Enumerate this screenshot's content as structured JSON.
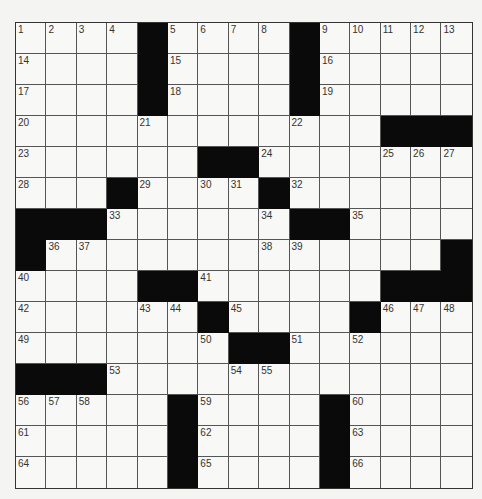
{
  "puzzle": {
    "rows": 15,
    "cols": 15,
    "colors": {
      "black": "#0a0a0a",
      "white": "#f8f8f6",
      "line": "#555555"
    },
    "black_cells": [
      [
        0,
        4
      ],
      [
        0,
        9
      ],
      [
        1,
        4
      ],
      [
        1,
        9
      ],
      [
        2,
        4
      ],
      [
        2,
        9
      ],
      [
        3,
        12
      ],
      [
        3,
        13
      ],
      [
        3,
        14
      ],
      [
        4,
        6
      ],
      [
        4,
        7
      ],
      [
        5,
        3
      ],
      [
        5,
        8
      ],
      [
        6,
        0
      ],
      [
        6,
        1
      ],
      [
        6,
        2
      ],
      [
        6,
        9
      ],
      [
        6,
        10
      ],
      [
        7,
        0
      ],
      [
        7,
        14
      ],
      [
        8,
        4
      ],
      [
        8,
        5
      ],
      [
        8,
        12
      ],
      [
        8,
        13
      ],
      [
        8,
        14
      ],
      [
        9,
        6
      ],
      [
        9,
        11
      ],
      [
        10,
        7
      ],
      [
        10,
        8
      ],
      [
        11,
        0
      ],
      [
        11,
        1
      ],
      [
        11,
        2
      ],
      [
        12,
        5
      ],
      [
        12,
        10
      ],
      [
        13,
        5
      ],
      [
        13,
        10
      ],
      [
        14,
        5
      ],
      [
        14,
        10
      ]
    ],
    "numbers": [
      {
        "r": 0,
        "c": 0,
        "n": "1"
      },
      {
        "r": 0,
        "c": 1,
        "n": "2"
      },
      {
        "r": 0,
        "c": 2,
        "n": "3"
      },
      {
        "r": 0,
        "c": 3,
        "n": "4"
      },
      {
        "r": 0,
        "c": 5,
        "n": "5"
      },
      {
        "r": 0,
        "c": 6,
        "n": "6"
      },
      {
        "r": 0,
        "c": 7,
        "n": "7"
      },
      {
        "r": 0,
        "c": 8,
        "n": "8"
      },
      {
        "r": 0,
        "c": 10,
        "n": "9"
      },
      {
        "r": 0,
        "c": 11,
        "n": "10"
      },
      {
        "r": 0,
        "c": 12,
        "n": "11"
      },
      {
        "r": 0,
        "c": 13,
        "n": "12"
      },
      {
        "r": 0,
        "c": 14,
        "n": "13"
      },
      {
        "r": 1,
        "c": 0,
        "n": "14"
      },
      {
        "r": 1,
        "c": 5,
        "n": "15"
      },
      {
        "r": 1,
        "c": 10,
        "n": "16"
      },
      {
        "r": 2,
        "c": 0,
        "n": "17"
      },
      {
        "r": 2,
        "c": 5,
        "n": "18"
      },
      {
        "r": 2,
        "c": 10,
        "n": "19"
      },
      {
        "r": 3,
        "c": 0,
        "n": "20"
      },
      {
        "r": 3,
        "c": 4,
        "n": "21"
      },
      {
        "r": 3,
        "c": 9,
        "n": "22"
      },
      {
        "r": 4,
        "c": 0,
        "n": "23"
      },
      {
        "r": 4,
        "c": 8,
        "n": "24"
      },
      {
        "r": 4,
        "c": 12,
        "n": "25"
      },
      {
        "r": 4,
        "c": 13,
        "n": "26"
      },
      {
        "r": 4,
        "c": 14,
        "n": "27"
      },
      {
        "r": 5,
        "c": 0,
        "n": "28"
      },
      {
        "r": 5,
        "c": 4,
        "n": "29"
      },
      {
        "r": 5,
        "c": 6,
        "n": "30"
      },
      {
        "r": 5,
        "c": 7,
        "n": "31"
      },
      {
        "r": 5,
        "c": 9,
        "n": "32"
      },
      {
        "r": 6,
        "c": 3,
        "n": "33"
      },
      {
        "r": 6,
        "c": 8,
        "n": "34"
      },
      {
        "r": 6,
        "c": 11,
        "n": "35"
      },
      {
        "r": 7,
        "c": 1,
        "n": "36"
      },
      {
        "r": 7,
        "c": 2,
        "n": "37"
      },
      {
        "r": 7,
        "c": 8,
        "n": "38"
      },
      {
        "r": 7,
        "c": 9,
        "n": "39"
      },
      {
        "r": 8,
        "c": 0,
        "n": "40"
      },
      {
        "r": 8,
        "c": 6,
        "n": "41"
      },
      {
        "r": 9,
        "c": 0,
        "n": "42"
      },
      {
        "r": 9,
        "c": 4,
        "n": "43"
      },
      {
        "r": 9,
        "c": 5,
        "n": "44"
      },
      {
        "r": 9,
        "c": 7,
        "n": "45"
      },
      {
        "r": 9,
        "c": 12,
        "n": "46"
      },
      {
        "r": 9,
        "c": 13,
        "n": "47"
      },
      {
        "r": 9,
        "c": 14,
        "n": "48"
      },
      {
        "r": 10,
        "c": 0,
        "n": "49"
      },
      {
        "r": 10,
        "c": 6,
        "n": "50"
      },
      {
        "r": 10,
        "c": 9,
        "n": "51"
      },
      {
        "r": 10,
        "c": 11,
        "n": "52"
      },
      {
        "r": 11,
        "c": 3,
        "n": "53"
      },
      {
        "r": 11,
        "c": 7,
        "n": "54"
      },
      {
        "r": 11,
        "c": 8,
        "n": "55"
      },
      {
        "r": 12,
        "c": 0,
        "n": "56"
      },
      {
        "r": 12,
        "c": 1,
        "n": "57"
      },
      {
        "r": 12,
        "c": 2,
        "n": "58"
      },
      {
        "r": 12,
        "c": 6,
        "n": "59"
      },
      {
        "r": 12,
        "c": 11,
        "n": "60"
      },
      {
        "r": 13,
        "c": 0,
        "n": "61"
      },
      {
        "r": 13,
        "c": 6,
        "n": "62"
      },
      {
        "r": 13,
        "c": 11,
        "n": "63"
      },
      {
        "r": 14,
        "c": 0,
        "n": "64"
      },
      {
        "r": 14,
        "c": 6,
        "n": "65"
      },
      {
        "r": 14,
        "c": 11,
        "n": "66"
      }
    ]
  }
}
